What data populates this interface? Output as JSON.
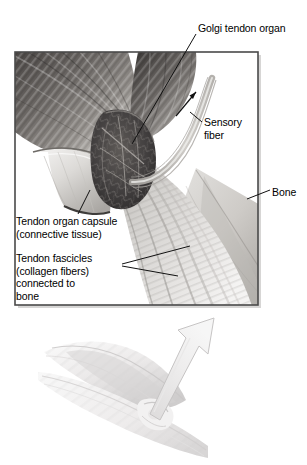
{
  "figure": {
    "panels": [
      {
        "name": "detail-panel",
        "description": "Framed cutaway illustration of a Golgi tendon organ at the muscle-tendon junction"
      },
      {
        "name": "arm-panel",
        "description": "Flexed arm with arrow indicating direction of tendon force"
      }
    ]
  },
  "labels": {
    "golgi_tendon_organ": "Golgi tendon organ",
    "sensory_fiber_line1": "Sensory",
    "sensory_fiber_line2": "fiber",
    "bone": "Bone",
    "capsule_line1": "Tendon organ capsule",
    "capsule_line2": "(connective tissue)",
    "fascicles_line1": "Tendon fascicles",
    "fascicles_line2": "(collagen fibers)",
    "fascicles_line3": "connected to",
    "fascicles_line4": "bone"
  },
  "icons": {
    "signal_direction_arrow": "arrow-up-right-icon",
    "force_direction_arrow": "large-arrow-up-right-icon"
  },
  "colors": {
    "background": "#ffffff",
    "frame_border": "#4a4a4a",
    "muscle_dark": "#55514f",
    "muscle_mid": "#7e7a77",
    "tendon_light": "#d7d5d2",
    "tendon_mid": "#a8a5a2",
    "organ_dark": "#3c3a38",
    "capsule_light": "#e8e7e5",
    "bone_light": "#cfcdca",
    "arm_light": "#ebebea",
    "label_text": "#000000",
    "leader_line": "#1a1a1a"
  }
}
